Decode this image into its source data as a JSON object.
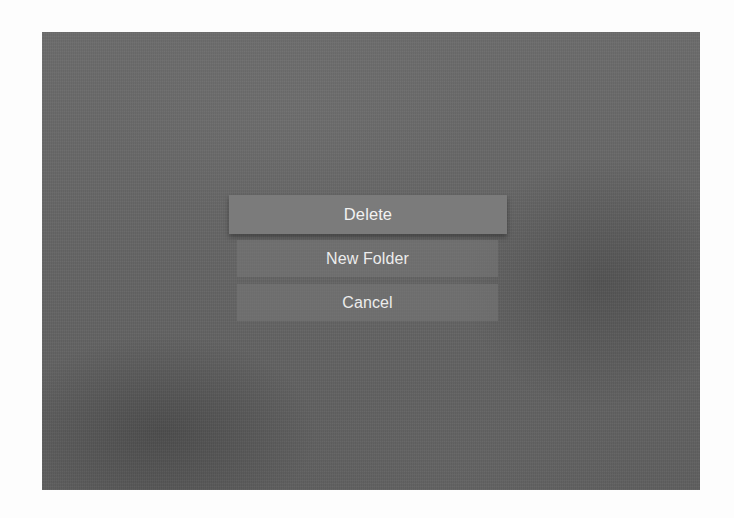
{
  "screen": {
    "description": "tvOS-style action sheet over blurred grey background"
  },
  "menu": {
    "focused_index": 0,
    "items": [
      {
        "label": "Delete",
        "state": "focused"
      },
      {
        "label": "New Folder",
        "state": "normal"
      },
      {
        "label": "Cancel",
        "state": "normal"
      }
    ]
  },
  "colors": {
    "page_background": "#fdfdfd",
    "screen_background": "#656565",
    "focused_button": "#7b7b7b",
    "normal_button": "#6e6e6e",
    "button_text": "#ececec"
  }
}
